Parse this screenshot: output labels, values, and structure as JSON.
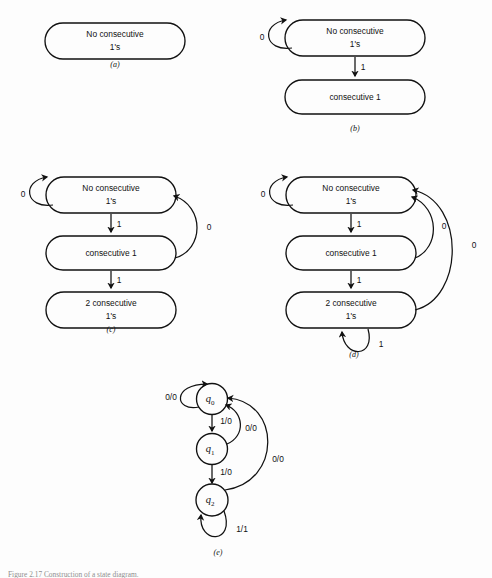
{
  "figure": {
    "caption": "Figure 2.17  Construction of a state diagram.",
    "panels": [
      {
        "id": "a",
        "caption": "(a)",
        "states": [
          {
            "name": "state-no-consecutive",
            "line1": "No  consecutive",
            "line2": "1's"
          }
        ],
        "transitions": []
      },
      {
        "id": "b",
        "caption": "(b)",
        "states": [
          {
            "name": "state-no-consecutive",
            "line1": "No  consecutive",
            "line2": "1's"
          },
          {
            "name": "state-consecutive-1",
            "line1": "consecutive   1",
            "line2": ""
          }
        ],
        "transitions": [
          {
            "name": "self-loop-no-consecutive",
            "label": "0"
          },
          {
            "name": "edge-no-consecutive-to-consecutive-1",
            "label": "1"
          }
        ]
      },
      {
        "id": "c",
        "caption": "(c)",
        "states": [
          {
            "name": "state-no-consecutive",
            "line1": "No  consecutive",
            "line2": "1's"
          },
          {
            "name": "state-consecutive-1",
            "line1": "consecutive   1",
            "line2": ""
          },
          {
            "name": "state-2-consecutive",
            "line1": "2  consecutive",
            "line2": "1's"
          }
        ],
        "transitions": [
          {
            "name": "self-loop-no-consecutive",
            "label": "0"
          },
          {
            "name": "edge-no-consecutive-to-consecutive-1",
            "label": "1"
          },
          {
            "name": "edge-consecutive-1-to-2-consecutive",
            "label": "1"
          },
          {
            "name": "edge-consecutive-1-back-to-no-consecutive",
            "label": "0"
          }
        ]
      },
      {
        "id": "d",
        "caption": "(d)",
        "states": [
          {
            "name": "state-no-consecutive",
            "line1": "No  consecutive",
            "line2": "1's"
          },
          {
            "name": "state-consecutive-1",
            "line1": "consecutive   1",
            "line2": ""
          },
          {
            "name": "state-2-consecutive",
            "line1": "2  consecutive",
            "line2": "1's"
          }
        ],
        "transitions": [
          {
            "name": "self-loop-no-consecutive",
            "label": "0"
          },
          {
            "name": "edge-no-consecutive-to-consecutive-1",
            "label": "1"
          },
          {
            "name": "edge-consecutive-1-to-2-consecutive",
            "label": "1"
          },
          {
            "name": "edge-consecutive-1-back-to-no-consecutive",
            "label": "0"
          },
          {
            "name": "edge-2-consecutive-back-to-no-consecutive",
            "label": "0"
          },
          {
            "name": "self-loop-2-consecutive",
            "label": "1"
          }
        ]
      },
      {
        "id": "e",
        "caption": "(e)",
        "states": [
          {
            "name": "state-q0",
            "symbol": "q",
            "subscript": "0"
          },
          {
            "name": "state-q1",
            "symbol": "q",
            "subscript": "1"
          },
          {
            "name": "state-q2",
            "symbol": "q",
            "subscript": "2"
          }
        ],
        "transitions": [
          {
            "name": "self-loop-q0",
            "label": "0/0"
          },
          {
            "name": "edge-q0-to-q1",
            "label": "1/0"
          },
          {
            "name": "edge-q1-to-q0",
            "label": "0/0"
          },
          {
            "name": "edge-q1-to-q2",
            "label": "1/0"
          },
          {
            "name": "edge-q2-to-q0",
            "label": "0/0"
          },
          {
            "name": "self-loop-q2",
            "label": "1/1"
          }
        ]
      }
    ]
  },
  "style": {
    "ink": "#111111",
    "paper": "#fdfdfd"
  }
}
